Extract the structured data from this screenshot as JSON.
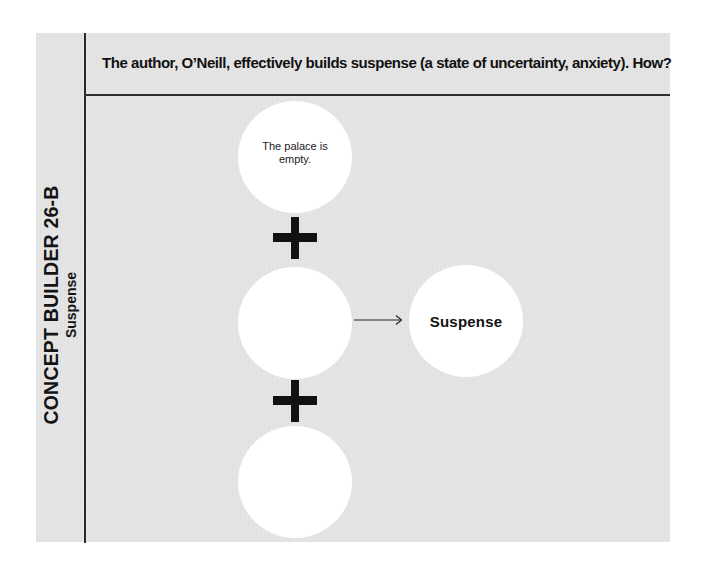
{
  "side": {
    "title": "CONCEPT BUILDER 26-B",
    "subtitle": "Suspense"
  },
  "header": {
    "question": "The author, O’Neill, effectively builds suspense (a state of uncertainty, anxiety). How?"
  },
  "diagram": {
    "inputs": [
      {
        "text": "The palace is empty."
      },
      {
        "text": ""
      },
      {
        "text": ""
      }
    ],
    "operator_icon": "plus-icon",
    "connector_icon": "arrow-right-icon",
    "result": {
      "text": "Suspense"
    }
  },
  "colors": {
    "panel_background": "#e4e4e4",
    "circle_fill": "#ffffff",
    "rule_color": "#2a2a2a",
    "text_color": "#111111"
  }
}
